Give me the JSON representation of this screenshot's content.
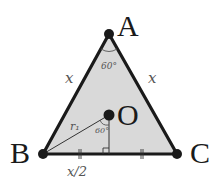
{
  "diagram": {
    "colors": {
      "fill": "#d9d9d9",
      "stroke": "#1a1a1a",
      "annotation": "#555555",
      "background": "#ffffff"
    },
    "vertices": {
      "A": {
        "label": "A",
        "x": 109,
        "y": 34
      },
      "B": {
        "label": "B",
        "x": 43,
        "y": 154
      },
      "C": {
        "label": "C",
        "x": 177,
        "y": 154
      }
    },
    "center": {
      "label": "O",
      "x": 109,
      "y": 115
    },
    "foot": {
      "x": 109,
      "y": 154
    },
    "annotations": {
      "side_left": "x",
      "side_right": "x",
      "angle_A": "60°",
      "angle_O": "60°",
      "radius": "r₁",
      "half_base": "x/2"
    }
  }
}
